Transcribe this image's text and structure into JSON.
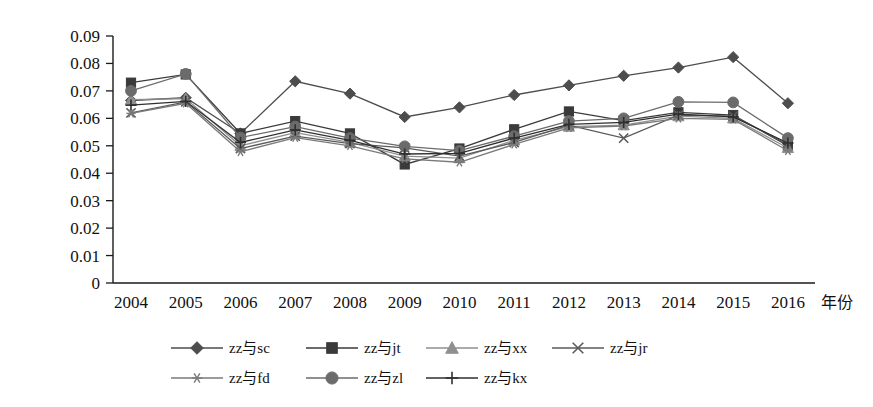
{
  "chart_data": {
    "type": "line",
    "title": "",
    "xlabel": "年份",
    "ylabel": "",
    "categories": [
      "2004",
      "2005",
      "2006",
      "2007",
      "2008",
      "2009",
      "2010",
      "2011",
      "2012",
      "2013",
      "2014",
      "2015",
      "2016"
    ],
    "ylim": [
      0,
      0.09
    ],
    "yticks": [
      "0",
      "0.01",
      "0.02",
      "0.03",
      "0.04",
      "0.05",
      "0.06",
      "0.07",
      "0.08",
      "0.09"
    ],
    "ytick_values": [
      0,
      0.01,
      0.02,
      0.03,
      0.04,
      0.05,
      0.06,
      0.07,
      0.08,
      0.09
    ],
    "grid": false,
    "legend_position": "bottom",
    "series": [
      {
        "name": "zz与sc",
        "marker": "diamond",
        "color": "#4d4d4d",
        "values": [
          0.0665,
          0.0675,
          0.0545,
          0.0735,
          0.069,
          0.0605,
          0.064,
          0.0685,
          0.072,
          0.0755,
          0.0785,
          0.0823,
          0.0655
        ]
      },
      {
        "name": "zz与jt",
        "marker": "square",
        "color": "#3a3a3a",
        "values": [
          0.073,
          0.076,
          0.0545,
          0.059,
          0.0545,
          0.0432,
          0.049,
          0.056,
          0.0625,
          0.0592,
          0.0622,
          0.0612,
          0.05
        ]
      },
      {
        "name": "zz与xx",
        "marker": "triangle",
        "color": "#8f8f8f",
        "values": [
          0.0668,
          0.0672,
          0.05,
          0.0548,
          0.0512,
          0.0462,
          0.0455,
          0.052,
          0.057,
          0.0575,
          0.0608,
          0.06,
          0.0492
        ]
      },
      {
        "name": "zz与jr",
        "marker": "cross",
        "color": "#5a5a5a",
        "values": [
          0.062,
          0.066,
          0.049,
          0.0535,
          0.0508,
          0.0492,
          0.0462,
          0.0512,
          0.0575,
          0.0528,
          0.0612,
          0.0608,
          0.0505
        ]
      },
      {
        "name": "zz与fd",
        "marker": "asterisk",
        "color": "#7a7a7a",
        "values": [
          0.0618,
          0.0655,
          0.0478,
          0.053,
          0.05,
          0.0452,
          0.044,
          0.0505,
          0.0565,
          0.0572,
          0.06,
          0.0596,
          0.0482
        ]
      },
      {
        "name": "zz与zl",
        "marker": "circle",
        "color": "#6b6b6b",
        "values": [
          0.07,
          0.0762,
          0.053,
          0.057,
          0.0528,
          0.0498,
          0.0482,
          0.0535,
          0.059,
          0.06,
          0.066,
          0.0658,
          0.0528
        ]
      },
      {
        "name": "zz与kx",
        "marker": "plus",
        "color": "#2f2f2f",
        "values": [
          0.0648,
          0.0662,
          0.0512,
          0.0558,
          0.052,
          0.047,
          0.0472,
          0.0528,
          0.0578,
          0.0585,
          0.0615,
          0.0605,
          0.051
        ]
      }
    ]
  },
  "legend": {
    "rows": [
      [
        "zz与sc",
        "zz与jt",
        "zz与xx",
        "zz与jr"
      ],
      [
        "zz与fd",
        "zz与zl",
        "zz与kx"
      ]
    ]
  }
}
